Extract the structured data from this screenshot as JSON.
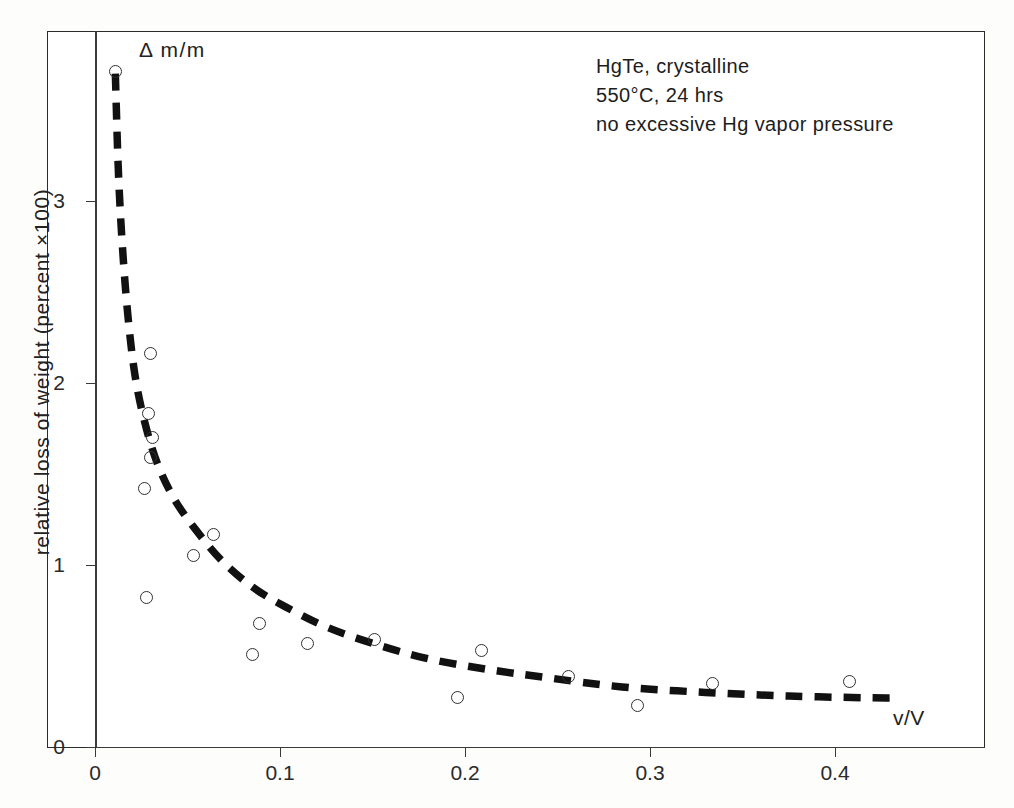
{
  "chart_data": {
    "type": "scatter",
    "title": "",
    "xlabel": "v/V",
    "ylabel": "relative loss of weight  (percent ×100)",
    "corner_label": "Δ m/m",
    "xlim": [
      0,
      0.4805
    ],
    "ylim": [
      0,
      3.85
    ],
    "grid": false,
    "legend": null,
    "xticks": [
      0,
      0.1,
      0.2,
      0.3,
      0.4
    ],
    "xtick_labels": [
      "0",
      "0.1",
      "0.2",
      "0.3",
      "0.4"
    ],
    "yticks": [
      0,
      1,
      2,
      3
    ],
    "ytick_labels": [
      "0",
      "1",
      "2",
      "3"
    ],
    "annotations": [
      "HgTe, crystalline",
      "550°C, 24 hrs",
      "no excessive Hg vapor pressure"
    ],
    "series": [
      {
        "name": "measured points",
        "marker": "open-circle",
        "points": [
          {
            "x": 0.011,
            "y": 3.71
          },
          {
            "x": 0.03,
            "y": 2.16
          },
          {
            "x": 0.029,
            "y": 1.83
          },
          {
            "x": 0.031,
            "y": 1.7
          },
          {
            "x": 0.03,
            "y": 1.59
          },
          {
            "x": 0.027,
            "y": 1.42
          },
          {
            "x": 0.064,
            "y": 1.17
          },
          {
            "x": 0.053,
            "y": 1.05
          },
          {
            "x": 0.028,
            "y": 0.82
          },
          {
            "x": 0.089,
            "y": 0.68
          },
          {
            "x": 0.115,
            "y": 0.57
          },
          {
            "x": 0.151,
            "y": 0.59
          },
          {
            "x": 0.085,
            "y": 0.51
          },
          {
            "x": 0.209,
            "y": 0.53
          },
          {
            "x": 0.256,
            "y": 0.39
          },
          {
            "x": 0.334,
            "y": 0.35
          },
          {
            "x": 0.408,
            "y": 0.36
          },
          {
            "x": 0.196,
            "y": 0.27
          },
          {
            "x": 0.293,
            "y": 0.23
          }
        ]
      },
      {
        "name": "fitted trend (dashed)",
        "marker": "none",
        "style": "dashed",
        "points": [
          {
            "x": 0.011,
            "y": 3.7
          },
          {
            "x": 0.0125,
            "y": 3.2
          },
          {
            "x": 0.0145,
            "y": 2.8
          },
          {
            "x": 0.0175,
            "y": 2.4
          },
          {
            "x": 0.0215,
            "y": 2.05
          },
          {
            "x": 0.027,
            "y": 1.78
          },
          {
            "x": 0.034,
            "y": 1.55
          },
          {
            "x": 0.043,
            "y": 1.36
          },
          {
            "x": 0.054,
            "y": 1.2
          },
          {
            "x": 0.068,
            "y": 1.03
          },
          {
            "x": 0.085,
            "y": 0.88
          },
          {
            "x": 0.103,
            "y": 0.77
          },
          {
            "x": 0.125,
            "y": 0.66
          },
          {
            "x": 0.15,
            "y": 0.57
          },
          {
            "x": 0.178,
            "y": 0.49
          },
          {
            "x": 0.21,
            "y": 0.43
          },
          {
            "x": 0.245,
            "y": 0.38
          },
          {
            "x": 0.285,
            "y": 0.33
          },
          {
            "x": 0.33,
            "y": 0.3
          },
          {
            "x": 0.375,
            "y": 0.28
          },
          {
            "x": 0.42,
            "y": 0.27
          },
          {
            "x": 0.435,
            "y": 0.27
          }
        ]
      }
    ],
    "axis_pixels": {
      "x0_px": 95,
      "x_per_unit_px": 1850,
      "y0_px": 747,
      "y_per_unit_px": 182
    }
  }
}
